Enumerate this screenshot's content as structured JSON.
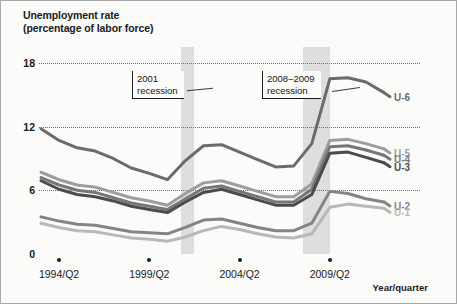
{
  "figure": {
    "title_line1": "Unemployment rate",
    "title_line2": "(percentage of labor force)",
    "xaxis_label": "Year/quarter"
  },
  "annotations": [
    {
      "id": "recession-2001",
      "line1": "2001",
      "line2": "recession"
    },
    {
      "id": "recession-2008-2009",
      "line1": "2008–2009",
      "line2": "recession"
    }
  ],
  "chart_data": {
    "type": "line",
    "title": "Unemployment rate (percentage of labor force)",
    "xlabel": "Year/quarter",
    "ylabel": "Unemployment rate (percentage of labor force)",
    "ylim": [
      0,
      19.5
    ],
    "yticks": [
      0,
      6,
      12,
      18
    ],
    "ytick_labels": [
      "0",
      "6",
      "12",
      "18"
    ],
    "grid": "horizontal dotted at 6, 12, 18",
    "legend_position": "right end of each line",
    "xlim": [
      "1993/Q2",
      "2011/Q4"
    ],
    "xticks": [
      "1994/Q2",
      "1999/Q2",
      "2004/Q2",
      "2009/Q2"
    ],
    "xtick_labels": [
      "1994/Q2",
      "1999/Q2",
      "2004/Q2",
      "2009/Q2"
    ],
    "shaded_regions": [
      {
        "label": "2001 recession",
        "start": "2001/Q1",
        "end": "2001/Q4"
      },
      {
        "label": "2008–2009 recession",
        "start": "2007/Q4",
        "end": "2009/Q2"
      }
    ],
    "x": [
      "1993/Q2",
      "1994/Q2",
      "1995/Q2",
      "1996/Q2",
      "1997/Q2",
      "1998/Q2",
      "1999/Q2",
      "2000/Q2",
      "2001/Q2",
      "2002/Q2",
      "2003/Q2",
      "2004/Q2",
      "2005/Q2",
      "2006/Q2",
      "2007/Q2",
      "2008/Q2",
      "2009/Q2",
      "2010/Q2",
      "2011/Q2",
      "2011/Q4"
    ],
    "series": [
      {
        "name": "U-6",
        "label": "U-6",
        "color": "#6b6b6b",
        "values": [
          11.8,
          10.7,
          10.0,
          9.7,
          9.0,
          8.1,
          7.6,
          7.0,
          8.8,
          10.2,
          10.3,
          9.6,
          8.9,
          8.2,
          8.3,
          10.4,
          16.5,
          16.6,
          16.2,
          15.2
        ]
      },
      {
        "name": "U-5",
        "label": "U-5",
        "color": "#9d9d9d",
        "values": [
          7.7,
          7.0,
          6.5,
          6.3,
          5.8,
          5.3,
          5.0,
          4.6,
          5.7,
          6.7,
          6.9,
          6.4,
          5.9,
          5.4,
          5.4,
          6.6,
          10.7,
          10.8,
          10.4,
          9.9
        ]
      },
      {
        "name": "U-4",
        "label": "U-4",
        "color": "#777777",
        "values": [
          7.2,
          6.5,
          6.0,
          5.8,
          5.3,
          4.8,
          4.5,
          4.2,
          5.2,
          6.2,
          6.4,
          5.9,
          5.4,
          4.9,
          4.9,
          6.1,
          10.1,
          10.2,
          9.8,
          9.3
        ]
      },
      {
        "name": "U-3",
        "label": "U-3",
        "color": "#4b4b4b",
        "values": [
          6.9,
          6.1,
          5.6,
          5.4,
          5.0,
          4.5,
          4.2,
          3.9,
          4.9,
          5.8,
          6.1,
          5.6,
          5.1,
          4.6,
          4.6,
          5.6,
          9.5,
          9.6,
          9.1,
          8.6
        ]
      },
      {
        "name": "U-2",
        "label": "U-2",
        "color": "#848484",
        "values": [
          3.5,
          3.1,
          2.8,
          2.7,
          2.4,
          2.1,
          2.0,
          1.9,
          2.5,
          3.2,
          3.3,
          2.9,
          2.5,
          2.2,
          2.2,
          2.9,
          5.9,
          5.7,
          5.2,
          4.9
        ]
      },
      {
        "name": "U-1",
        "label": "U-1",
        "color": "#b8b8b8",
        "values": [
          2.9,
          2.5,
          2.2,
          2.1,
          1.8,
          1.5,
          1.4,
          1.2,
          1.6,
          2.2,
          2.6,
          2.3,
          1.9,
          1.6,
          1.5,
          1.9,
          4.4,
          4.7,
          4.5,
          4.3
        ]
      }
    ]
  }
}
